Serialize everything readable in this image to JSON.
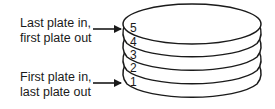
{
  "diagram": {
    "labels": {
      "top": {
        "line1": "Last plate in,",
        "line2": "first plate out"
      },
      "bottom": {
        "line1": "First plate in,",
        "line2": "last plate out"
      }
    },
    "plates": [
      {
        "number": "5",
        "position": "top"
      },
      {
        "number": "4",
        "position": "second"
      },
      {
        "number": "3",
        "position": "third"
      },
      {
        "number": "2",
        "position": "fourth"
      },
      {
        "number": "1",
        "position": "bottom"
      }
    ],
    "arrows": [
      {
        "from": "label-top",
        "to": "plate-5"
      },
      {
        "from": "label-bottom",
        "to": "plate-1"
      }
    ],
    "colors": {
      "stroke": "#1a1a1a",
      "background": "#ffffff"
    }
  }
}
